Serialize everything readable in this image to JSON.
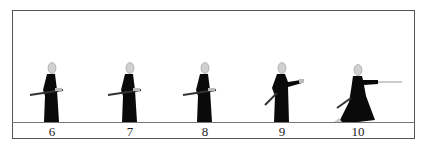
{
  "diagram": {
    "frames": [
      {
        "label": "6",
        "pose": "standing-hand-on-hilt",
        "x": 52
      },
      {
        "label": "7",
        "pose": "standing-hand-on-hilt",
        "x": 130
      },
      {
        "label": "8",
        "pose": "standing-hand-on-hilt",
        "x": 205
      },
      {
        "label": "9",
        "pose": "standing-drawing",
        "x": 282
      },
      {
        "label": "10",
        "pose": "lunge-thrust",
        "x": 358
      }
    ],
    "colors": {
      "figure": "#0a0a0a",
      "head": "#d0d0d0",
      "sword": "#c8c8c8",
      "frame": "#555555"
    }
  }
}
